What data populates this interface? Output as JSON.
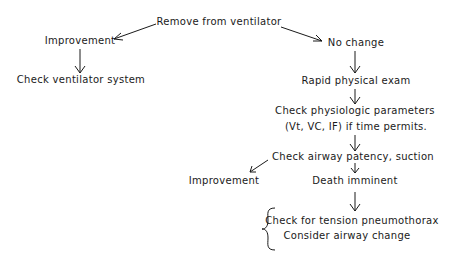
{
  "diagram": {
    "type": "flowchart",
    "nodes": {
      "remove": "Remove from ventilator",
      "improvement_top": "Improvement",
      "check_ventilator": "Check ventilator system",
      "no_change": "No change",
      "rapid_exam": "Rapid physical exam",
      "check_physiologic_line1": "Check physiologic parameters",
      "check_physiologic_line2": "(Vt, VC, IF) if time permits.",
      "check_airway": "Check airway patency, suction",
      "improvement_bottom": "Improvement",
      "death_imminent": "Death imminent",
      "tension_pneumothorax": "Check for tension pneumothorax",
      "airway_change": "Consider airway change"
    },
    "edges": [
      {
        "from": "remove",
        "to": "improvement_top"
      },
      {
        "from": "improvement_top",
        "to": "check_ventilator"
      },
      {
        "from": "remove",
        "to": "no_change"
      },
      {
        "from": "no_change",
        "to": "rapid_exam"
      },
      {
        "from": "rapid_exam",
        "to": "check_physiologic"
      },
      {
        "from": "check_physiologic",
        "to": "check_airway"
      },
      {
        "from": "check_airway",
        "to": "improvement_bottom"
      },
      {
        "from": "check_airway",
        "to": "death_imminent"
      },
      {
        "from": "death_imminent",
        "to": "final_actions"
      }
    ],
    "groups": [
      {
        "name": "final_actions",
        "bracket": "left-brace",
        "members": [
          "tension_pneumothorax",
          "airway_change"
        ]
      }
    ],
    "colors": {
      "ink": "#1a1a1a",
      "background": "#ffffff"
    }
  }
}
